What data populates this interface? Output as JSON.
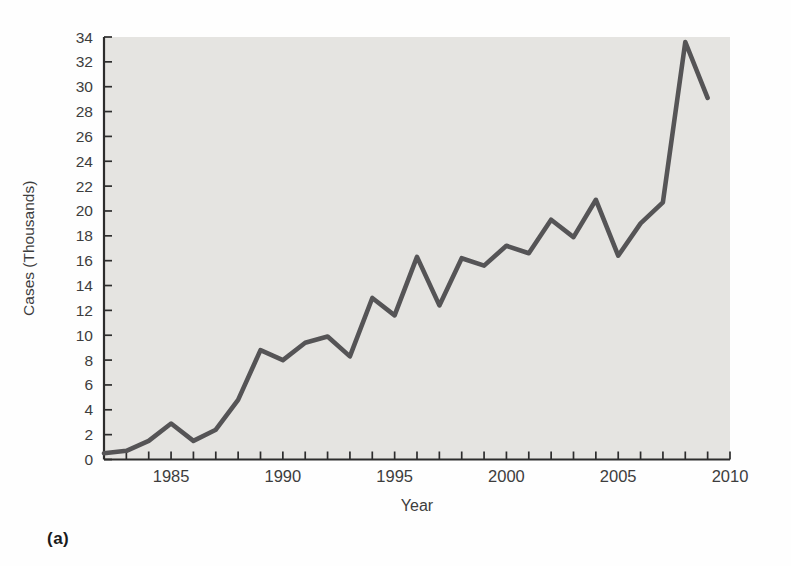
{
  "figure_label": "(a)",
  "chart_data": {
    "type": "line",
    "title": "",
    "xlabel": "Year",
    "ylabel": "Cases (Thousands)",
    "xlim": [
      1982,
      2010
    ],
    "ylim": [
      0,
      34
    ],
    "x_minor_tick_interval": 1,
    "y_tick_interval": 2,
    "x_labeled_ticks": [
      1985,
      1990,
      1995,
      2000,
      2005,
      2010
    ],
    "y_ticks": [
      0,
      2,
      4,
      6,
      8,
      10,
      12,
      14,
      16,
      18,
      20,
      22,
      24,
      26,
      28,
      30,
      32,
      34
    ],
    "grid": false,
    "legend": "none",
    "plot_background": "#e5e4e1",
    "line_color": "#555456",
    "axis_color": "#2d2d2d",
    "label_color": "#3d3d3d",
    "x": [
      1982,
      1983,
      1984,
      1985,
      1986,
      1987,
      1988,
      1989,
      1990,
      1991,
      1992,
      1993,
      1994,
      1995,
      1996,
      1997,
      1998,
      1999,
      2000,
      2001,
      2002,
      2003,
      2004,
      2005,
      2006,
      2007,
      2008,
      2009
    ],
    "series": [
      {
        "name": "Reported cases",
        "values": [
          0.5,
          0.7,
          1.5,
          2.9,
          1.5,
          2.4,
          4.8,
          8.8,
          8.0,
          9.4,
          9.9,
          8.3,
          13.0,
          11.6,
          16.3,
          12.4,
          16.2,
          15.6,
          17.2,
          16.6,
          19.3,
          17.9,
          20.9,
          16.4,
          19.0,
          20.7,
          33.6,
          29.1
        ]
      }
    ]
  }
}
